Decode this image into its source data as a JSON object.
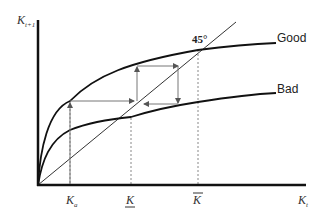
{
  "diagram": {
    "axes": {
      "y_label_main": "K",
      "y_label_sub": "t+1",
      "x_label_main": "K",
      "x_label_sub": "t"
    },
    "line_45_label": "45°",
    "curves": [
      {
        "name": "Good",
        "label": "Good"
      },
      {
        "name": "Bad",
        "label": "Bad"
      }
    ],
    "x_markers": [
      {
        "id": "ka",
        "main": "K",
        "sub": "a",
        "decoration": "none"
      },
      {
        "id": "k_under",
        "main": "K",
        "sub": "",
        "decoration": "underline"
      },
      {
        "id": "k_bar",
        "main": "K",
        "sub": "",
        "decoration": "overline"
      }
    ],
    "colors": {
      "axis": "#111111",
      "curve": "#111111",
      "arrow": "#777777",
      "dashed": "#888888"
    }
  }
}
